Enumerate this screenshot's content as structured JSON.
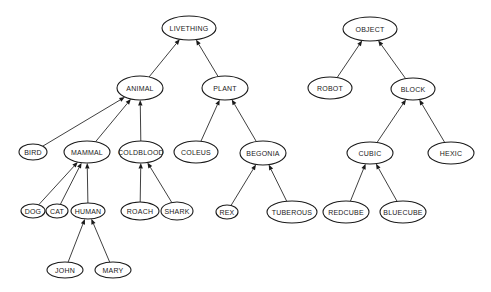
{
  "diagram": {
    "type": "inheritance-hierarchy",
    "background": "#ffffff",
    "stroke_color": "#1a1a1a",
    "trees": [
      {
        "root": "LIVETHING"
      },
      {
        "root": "OBJECT"
      }
    ],
    "nodes": [
      {
        "id": "LIVETHING",
        "label": "LIVETHING",
        "cx": 189,
        "cy": 28,
        "rx": 27,
        "ry": 12
      },
      {
        "id": "ANIMAL",
        "label": "ANIMAL",
        "cx": 140,
        "cy": 88,
        "rx": 23,
        "ry": 12
      },
      {
        "id": "PLANT",
        "label": "PLANT",
        "cx": 225,
        "cy": 88,
        "rx": 23,
        "ry": 12
      },
      {
        "id": "BIRD",
        "label": "BIRD",
        "cx": 33,
        "cy": 152,
        "rx": 14,
        "ry": 8
      },
      {
        "id": "MAMMAL",
        "label": "MAMMAL",
        "cx": 87,
        "cy": 152,
        "rx": 23,
        "ry": 11
      },
      {
        "id": "COLDBLOOD",
        "label": "COLDBLOOD",
        "cx": 141,
        "cy": 152,
        "rx": 22,
        "ry": 11
      },
      {
        "id": "COLEUS",
        "label": "COLEUS",
        "cx": 196,
        "cy": 152,
        "rx": 22,
        "ry": 11
      },
      {
        "id": "BEGONIA",
        "label": "BEGONIA",
        "cx": 263,
        "cy": 153,
        "rx": 23,
        "ry": 12
      },
      {
        "id": "DOG",
        "label": "DOG",
        "cx": 33,
        "cy": 211,
        "rx": 12,
        "ry": 7
      },
      {
        "id": "CAT",
        "label": "CAT",
        "cx": 57,
        "cy": 211,
        "rx": 11,
        "ry": 7
      },
      {
        "id": "HUMAN",
        "label": "HUMAN",
        "cx": 88,
        "cy": 211,
        "rx": 17,
        "ry": 8
      },
      {
        "id": "ROACH",
        "label": "ROACH",
        "cx": 140,
        "cy": 211,
        "rx": 19,
        "ry": 9
      },
      {
        "id": "SHARK",
        "label": "SHARK",
        "cx": 177,
        "cy": 211,
        "rx": 16,
        "ry": 9
      },
      {
        "id": "REX",
        "label": "REX",
        "cx": 227,
        "cy": 212,
        "rx": 11,
        "ry": 7
      },
      {
        "id": "TUBEROUS",
        "label": "TUBEROUS",
        "cx": 292,
        "cy": 212,
        "rx": 25,
        "ry": 11
      },
      {
        "id": "JOHN",
        "label": "JOHN",
        "cx": 65,
        "cy": 270,
        "rx": 18,
        "ry": 8
      },
      {
        "id": "MARY",
        "label": "MARY",
        "cx": 113,
        "cy": 270,
        "rx": 18,
        "ry": 8
      },
      {
        "id": "OBJECT",
        "label": "OBJECT",
        "cx": 370,
        "cy": 29,
        "rx": 27,
        "ry": 12
      },
      {
        "id": "ROBOT",
        "label": "ROBOT",
        "cx": 330,
        "cy": 88,
        "rx": 22,
        "ry": 11
      },
      {
        "id": "BLOCK",
        "label": "BLOCK",
        "cx": 413,
        "cy": 89,
        "rx": 22,
        "ry": 11
      },
      {
        "id": "CUBIC",
        "label": "CUBIC",
        "cx": 370,
        "cy": 153,
        "rx": 23,
        "ry": 11
      },
      {
        "id": "HEXIC",
        "label": "HEXIC",
        "cx": 451,
        "cy": 153,
        "rx": 23,
        "ry": 11
      },
      {
        "id": "REDCUBE",
        "label": "REDCUBE",
        "cx": 346,
        "cy": 212,
        "rx": 23,
        "ry": 11
      },
      {
        "id": "BLUECUBE",
        "label": "BLUECUBE",
        "cx": 403,
        "cy": 212,
        "rx": 23,
        "ry": 11
      }
    ],
    "edges": [
      {
        "from": "ANIMAL",
        "to": "LIVETHING"
      },
      {
        "from": "PLANT",
        "to": "LIVETHING"
      },
      {
        "from": "BIRD",
        "to": "ANIMAL"
      },
      {
        "from": "MAMMAL",
        "to": "ANIMAL"
      },
      {
        "from": "COLDBLOOD",
        "to": "ANIMAL"
      },
      {
        "from": "COLEUS",
        "to": "PLANT"
      },
      {
        "from": "BEGONIA",
        "to": "PLANT"
      },
      {
        "from": "DOG",
        "to": "MAMMAL"
      },
      {
        "from": "CAT",
        "to": "MAMMAL"
      },
      {
        "from": "HUMAN",
        "to": "MAMMAL"
      },
      {
        "from": "ROACH",
        "to": "COLDBLOOD"
      },
      {
        "from": "SHARK",
        "to": "COLDBLOOD"
      },
      {
        "from": "REX",
        "to": "BEGONIA"
      },
      {
        "from": "TUBEROUS",
        "to": "BEGONIA"
      },
      {
        "from": "JOHN",
        "to": "HUMAN"
      },
      {
        "from": "MARY",
        "to": "HUMAN"
      },
      {
        "from": "ROBOT",
        "to": "OBJECT"
      },
      {
        "from": "BLOCK",
        "to": "OBJECT"
      },
      {
        "from": "CUBIC",
        "to": "BLOCK"
      },
      {
        "from": "HEXIC",
        "to": "BLOCK"
      },
      {
        "from": "REDCUBE",
        "to": "CUBIC"
      },
      {
        "from": "BLUECUBE",
        "to": "CUBIC"
      }
    ]
  }
}
